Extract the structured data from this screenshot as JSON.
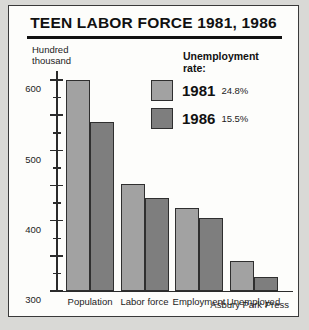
{
  "chart_data": {
    "type": "bar",
    "title": "TEEN LABOR FORCE 1981, 1986",
    "ylabel": "Hundred thousand",
    "xlabel": "",
    "categories": [
      "Population",
      "Labor force",
      "Employment",
      "Unemployed"
    ],
    "series": [
      {
        "name": "1981",
        "color": "#a2a2a2",
        "values": [
          600,
          303,
          235,
          85
        ]
      },
      {
        "name": "1986",
        "color": "#7e7e7e",
        "values": [
          480,
          265,
          207,
          40
        ]
      }
    ],
    "ylim": [
      0,
      600
    ],
    "yticks": [
      0,
      100,
      200,
      300,
      400,
      500,
      600
    ],
    "ytick_labels": [
      "0",
      "100",
      "200",
      "300",
      "400",
      "500",
      "600"
    ],
    "yminor_ticks": [
      50,
      150,
      250,
      350,
      450,
      550
    ],
    "grid": false,
    "legend_position": "upper-right",
    "annotations": [
      "Unemployment rate:",
      "1981 24.8%",
      "1986 15.5%"
    ]
  },
  "legend": {
    "title_line1": "Unemployment",
    "title_line2": "rate:",
    "rows": [
      {
        "year": "1981",
        "rate": "24.8%"
      },
      {
        "year": "1986",
        "rate": "15.5%"
      }
    ]
  },
  "y_caption": {
    "line1": "Hundred",
    "line2": "thousand"
  },
  "source": {
    "credit": "Asbury Park Press"
  }
}
